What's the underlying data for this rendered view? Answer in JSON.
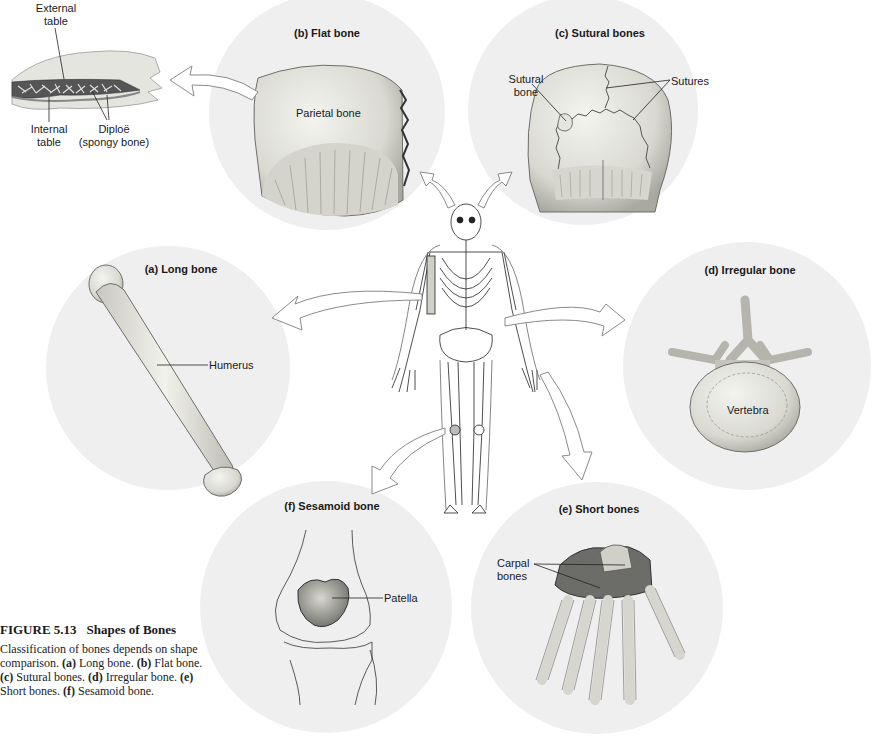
{
  "figure": {
    "number": "FIGURE 5.13",
    "title": "Shapes of Bones",
    "caption_intro": "Classification of bones depends on shape comparison.",
    "caption_items": [
      {
        "key": "(a)",
        "text": "Long bone."
      },
      {
        "key": "(b)",
        "text": "Flat bone."
      },
      {
        "key": "(c)",
        "text": "Sutural bones."
      },
      {
        "key": "(d)",
        "text": "Irregular bone."
      },
      {
        "key": "(e)",
        "text": "Short bones."
      },
      {
        "key": "(f)",
        "text": "Sesamoid bone."
      }
    ]
  },
  "center": {
    "name": "Human skeleton (anterior view)"
  },
  "panels": {
    "a": {
      "title": "(a) Long bone",
      "labels": [
        "Humerus"
      ]
    },
    "b": {
      "title": "(b) Flat bone",
      "labels": [
        "Parietal bone"
      ]
    },
    "c": {
      "title": "(c) Sutural bones",
      "labels": [
        "Sutural bone",
        "Sutures"
      ]
    },
    "d": {
      "title": "(d) Irregular bone",
      "labels": [
        "Vertebra"
      ]
    },
    "e": {
      "title": "(e) Short bones",
      "labels": [
        "Carpal bones"
      ]
    },
    "f": {
      "title": "(f) Sesamoid bone",
      "labels": [
        "Patella"
      ]
    }
  },
  "inset": {
    "labels": [
      "External table",
      "Internal table",
      "Diploë (spongy bone)"
    ]
  },
  "colors": {
    "circle_fill": "#efefef",
    "bone_fill": "#e2e2dc",
    "bone_shade": "#b9b9b2",
    "line": "#222222",
    "arrow_stroke": "#8a8a8a"
  }
}
